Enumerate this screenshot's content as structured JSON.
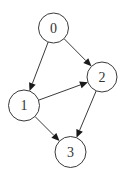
{
  "diagram": {
    "type": "directed-graph",
    "nodes": [
      {
        "id": "0",
        "label": "0",
        "cx": 53.5,
        "cy": 28,
        "r": 15
      },
      {
        "id": "1",
        "label": "1",
        "cx": 24,
        "cy": 105.5,
        "r": 15.5
      },
      {
        "id": "2",
        "label": "2",
        "cx": 102,
        "cy": 77,
        "r": 15
      },
      {
        "id": "3",
        "label": "3",
        "cx": 70.5,
        "cy": 152,
        "r": 15.5
      }
    ],
    "edges": [
      {
        "from": "0",
        "to": "1"
      },
      {
        "from": "0",
        "to": "2"
      },
      {
        "from": "1",
        "to": "2"
      },
      {
        "from": "1",
        "to": "3"
      },
      {
        "from": "2",
        "to": "3"
      }
    ],
    "colors": {
      "stroke": "#3a3a3a",
      "arrow": "#1a1a1a",
      "label": "#333333",
      "background": "#ffffff"
    }
  }
}
